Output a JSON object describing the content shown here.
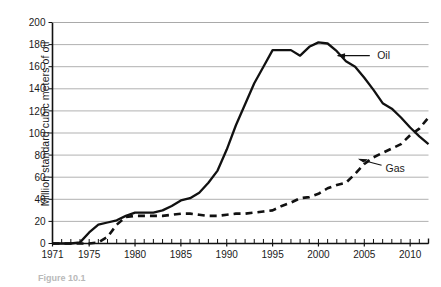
{
  "figure": {
    "caption_prefix": "Figure",
    "caption_number": "10.1"
  },
  "axes": {
    "ylabel": "Million standard cubic meters of oil",
    "xlabel": "",
    "y_ticks": [
      "0",
      "20",
      "40",
      "60",
      "80",
      "100",
      "120",
      "140",
      "160",
      "180",
      "200"
    ],
    "x_ticks": [
      "1971",
      "1975",
      "1980",
      "1985",
      "1990",
      "1995",
      "2000",
      "2005",
      "2010"
    ]
  },
  "annotations": {
    "oil": "Oil",
    "gas": "Gas"
  },
  "colors": {
    "line": "#111111",
    "grid": "#a8a8a8",
    "axis": "#111111",
    "caption": "#b9b9b9"
  },
  "chart_data": {
    "type": "line",
    "title": "",
    "xlabel": "",
    "ylabel": "Million standard cubic meters of oil",
    "xlim": [
      1971,
      2012
    ],
    "ylim": [
      0,
      200
    ],
    "grid": true,
    "legend_position": "inline-annotations",
    "x_tick_labels": [
      "1971",
      "1975",
      "1980",
      "1985",
      "1990",
      "1995",
      "2000",
      "2005",
      "2010"
    ],
    "y_tick_labels": [
      "0",
      "20",
      "40",
      "60",
      "80",
      "100",
      "120",
      "140",
      "160",
      "180",
      "200"
    ],
    "x_minor_tick_interval": 1,
    "x": [
      1971,
      1972,
      1973,
      1974,
      1975,
      1976,
      1977,
      1978,
      1979,
      1980,
      1981,
      1982,
      1983,
      1984,
      1985,
      1986,
      1987,
      1988,
      1989,
      1990,
      1991,
      1992,
      1993,
      1994,
      1995,
      1996,
      1997,
      1998,
      1999,
      2000,
      2001,
      2002,
      2003,
      2004,
      2005,
      2006,
      2007,
      2008,
      2009,
      2010,
      2011,
      2012
    ],
    "series": [
      {
        "name": "Oil",
        "style": "solid",
        "color": "#111111",
        "values": [
          0,
          0,
          0,
          1,
          10,
          17,
          19,
          21,
          25,
          28,
          28,
          28,
          30,
          34,
          39,
          41,
          46,
          55,
          66,
          85,
          107,
          126,
          145,
          160,
          175,
          175,
          175,
          170,
          178,
          182,
          181,
          174,
          165,
          160,
          150,
          139,
          127,
          122,
          114,
          105,
          97,
          90
        ]
      },
      {
        "name": "Gas",
        "style": "dashed",
        "color": "#111111",
        "values": [
          0,
          0,
          0,
          0,
          0,
          1,
          6,
          17,
          24,
          25,
          25,
          25,
          25,
          26,
          27,
          27,
          26,
          25,
          25,
          26,
          27,
          27,
          28,
          29,
          30,
          34,
          37,
          41,
          42,
          45,
          50,
          53,
          55,
          63,
          72,
          78,
          82,
          86,
          90,
          98,
          104,
          114
        ]
      }
    ],
    "annotations": [
      {
        "text": "Oil",
        "series": "Oil",
        "x": 2002,
        "y": 170
      },
      {
        "text": "Gas",
        "series": "Gas",
        "x": 2006,
        "y": 72
      }
    ]
  }
}
